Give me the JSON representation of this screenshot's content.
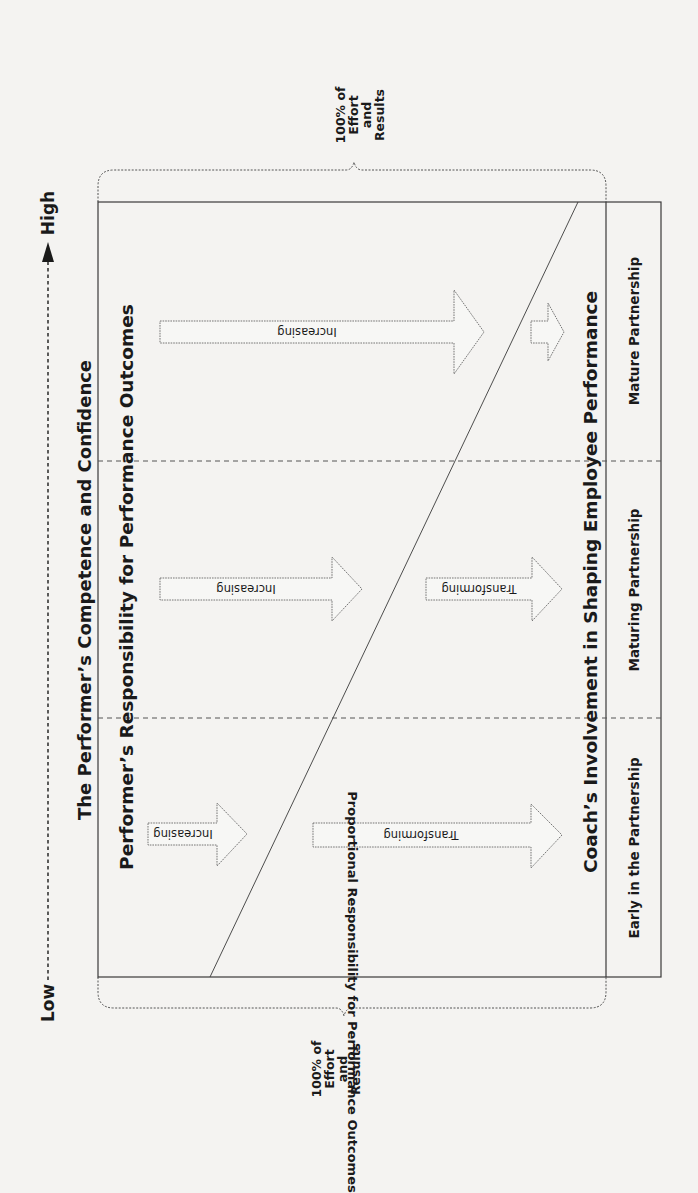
{
  "diagram": {
    "axis": {
      "low_label": "Low",
      "high_label": "High",
      "title": "The Performer’s Competence and Confidence"
    },
    "top_region_title": "Performer’s Responsibility for Performance Outcomes",
    "bottom_region_title": "Coach’s Involvement in Shaping Employee Performance",
    "side_bar_label": "Proportional Responsibility for Performance Outcomes",
    "brace_top": {
      "line1": "100% of",
      "line2": "Effort",
      "line3": "and",
      "line4": "Results"
    },
    "brace_bottom": {
      "line1": "100% of",
      "line2": "Effort",
      "line3": "and",
      "line4": "Results"
    },
    "phases": [
      {
        "label": "Early in the Partnership",
        "performer_arrow": "Increasing",
        "coach_arrow": "Transforming"
      },
      {
        "label": "Maturing Partnership",
        "performer_arrow": "Increasing",
        "coach_arrow": "Transforming"
      },
      {
        "label": "Mature Partnership",
        "performer_arrow": "Increasing",
        "coach_arrow": ""
      }
    ],
    "colors": {
      "line": "#3a3a3a",
      "dashed": "#555555",
      "background": "#f4f3f1",
      "text": "#1a1a1a"
    }
  }
}
